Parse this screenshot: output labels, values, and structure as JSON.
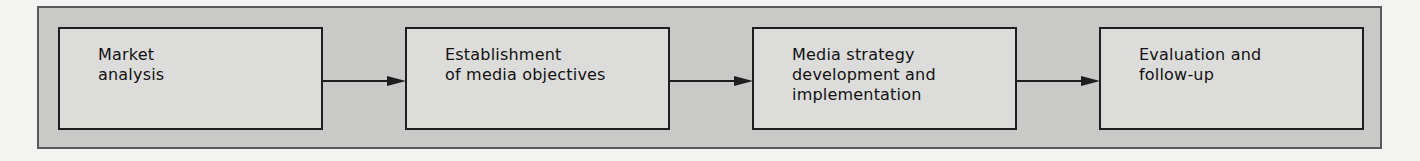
{
  "diagram": {
    "type": "flowchart",
    "direction": "left-to-right",
    "colors": {
      "page_background": "#f3f3f2",
      "panel_fill": "#c9c9c7",
      "step_fill": "#dcdcda",
      "stroke": "#1e1e1e",
      "text": "#111111"
    },
    "steps": [
      {
        "id": "market-analysis",
        "label": "Market\nanalysis"
      },
      {
        "id": "media-objectives",
        "label": "Establishment\nof media objectives"
      },
      {
        "id": "media-strategy",
        "label": "Media strategy\ndevelopment and\nimplementation"
      },
      {
        "id": "evaluation",
        "label": "Evaluation and\nfollow-up"
      }
    ],
    "connections": [
      {
        "from": "market-analysis",
        "to": "media-objectives"
      },
      {
        "from": "media-objectives",
        "to": "media-strategy"
      },
      {
        "from": "media-strategy",
        "to": "evaluation"
      }
    ]
  }
}
